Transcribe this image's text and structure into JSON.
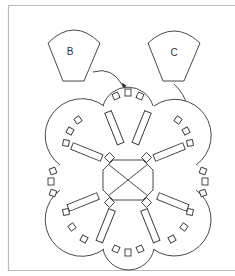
{
  "figure": {
    "piece_b_label": "B",
    "piece_c_label": "C"
  },
  "colors": {
    "stroke": "#333333",
    "frame": "#bbbbbb",
    "background": "#ffffff"
  }
}
